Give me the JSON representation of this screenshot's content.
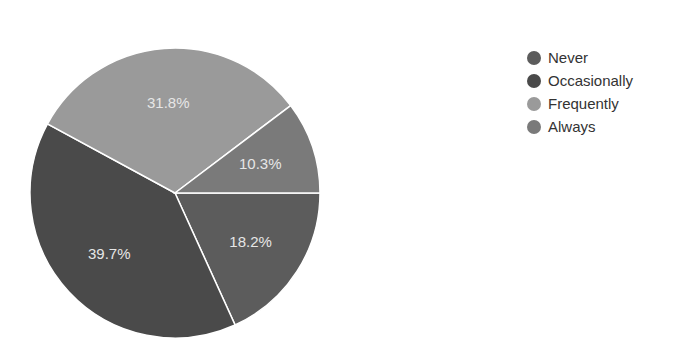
{
  "chart_data": {
    "type": "pie",
    "title": "",
    "categories": [
      "Never",
      "Occasionally",
      "Frequently",
      "Always"
    ],
    "values": [
      18.2,
      39.7,
      31.8,
      10.3
    ],
    "labels": [
      "18.2%",
      "39.7%",
      "31.8%",
      "10.3%"
    ],
    "colors": [
      "#5c5c5c",
      "#4a4a4a",
      "#9a9a9a",
      "#7a7a7a"
    ],
    "start_angle": "3 o'clock",
    "direction": "clockwise",
    "legend_position": "right"
  },
  "legend": {
    "items": [
      {
        "label": "Never",
        "color": "#5c5c5c"
      },
      {
        "label": "Occasionally",
        "color": "#4a4a4a"
      },
      {
        "label": "Frequently",
        "color": "#9a9a9a"
      },
      {
        "label": "Always",
        "color": "#7a7a7a"
      }
    ]
  }
}
